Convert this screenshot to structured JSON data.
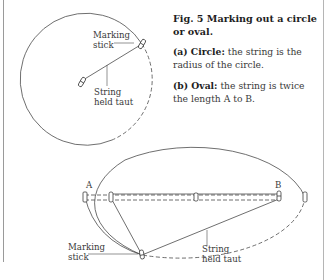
{
  "caption": {
    "title": "Fig. 5  Marking out a circle or oval.",
    "items": [
      {
        "prefix": "(a) Circle:",
        "text": " the string is the radius of the circle."
      },
      {
        "prefix": "(b) Oval:",
        "text": " the string is twice the length A to B."
      }
    ]
  },
  "circle_diagram": {
    "marking_stick_label": [
      "Marking",
      "stick"
    ],
    "string_label": [
      "String",
      "held taut"
    ]
  },
  "oval_diagram": {
    "point_a": "A",
    "point_b": "B",
    "marking_stick_label": [
      "Marking",
      "stick"
    ],
    "string_label": [
      "String",
      "held taut"
    ]
  },
  "colors": {
    "line": "#4a4a4a",
    "text": "#2a2a2a",
    "background": "#ffffff"
  }
}
